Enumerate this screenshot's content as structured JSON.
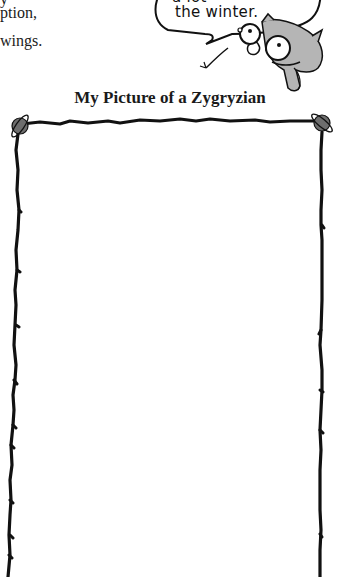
{
  "body_text": {
    "lines": [
      "y",
      "ption,",
      "wings."
    ]
  },
  "speech_bubble": {
    "lines": [
      "a lot",
      "the winter."
    ],
    "icon": "bird-creature-icon"
  },
  "worksheet": {
    "title": "My Picture of a Zygryzian",
    "frame": {
      "corner_icon": "ringed-planet-icon",
      "border_color": "#111111",
      "planet_color": "#6e6e6e"
    },
    "drawing_area_placeholder": ""
  },
  "colors": {
    "ink": "#111111",
    "creature_gray": "#b5b5b5",
    "background": "#ffffff"
  }
}
